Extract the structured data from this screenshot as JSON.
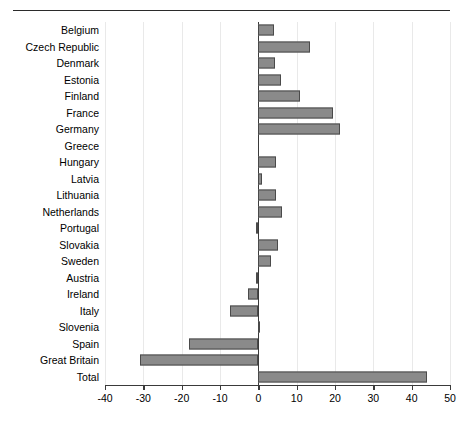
{
  "header": {
    "rule_visible": true,
    "cut_title": ""
  },
  "chart_data": {
    "type": "bar",
    "orientation": "horizontal",
    "title": "",
    "subtitle": "",
    "xlabel": "",
    "ylabel": "",
    "xlim": [
      -40,
      50
    ],
    "ylim": null,
    "grid": true,
    "legend": false,
    "legend_position": "none",
    "xticks": [
      -40,
      -30,
      -20,
      -10,
      0,
      10,
      20,
      30,
      40,
      50
    ],
    "xticklabels": [
      "-40",
      "-30",
      "-20",
      "-10",
      "0",
      "10",
      "20",
      "30",
      "40",
      "50"
    ],
    "categories": [
      "Belgium",
      "Czech Republic",
      "Denmark",
      "Estonia",
      "Finland",
      "France",
      "Germany",
      "Greece",
      "Hungary",
      "Latvia",
      "Lithuania",
      "Netherlands",
      "Portugal",
      "Slovakia",
      "Sweden",
      "Austria",
      "Ireland",
      "Italy",
      "Slovenia",
      "Spain",
      "Great Britain",
      "Total"
    ],
    "values": [
      4.1,
      13.4,
      4.3,
      6.0,
      11.0,
      19.5,
      21.2,
      0.0,
      4.6,
      1.0,
      4.6,
      6.2,
      -0.6,
      5.2,
      3.4,
      -0.6,
      -2.6,
      -7.4,
      -0.2,
      -18.0,
      -31.0,
      44.0
    ],
    "bar_color": "#8a8a8a",
    "bar_edge_color": "#4a4a4a",
    "zero_line_color": "#3a3a3a",
    "grid_color": "#e9e9e9"
  }
}
